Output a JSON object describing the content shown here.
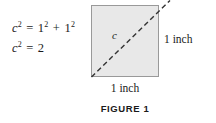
{
  "figure": {
    "caption": "FIGURE 1",
    "equations": [
      {
        "lhs_var": "c",
        "lhs_exp": "2",
        "equals": "=",
        "terms": [
          {
            "base": "1",
            "exp": "2"
          },
          {
            "base": "1",
            "exp": "2"
          }
        ],
        "operator": "+",
        "text": "c2 = 12 + 12"
      },
      {
        "lhs_var": "c",
        "lhs_exp": "2",
        "equals": "=",
        "result": "2",
        "text": "c2 = 2"
      }
    ],
    "shape": {
      "type": "square",
      "fill_color": "#e8e8e8",
      "border_color": "#999999",
      "diagonal_style": "dashed",
      "diagonal_color": "#333333",
      "diagonal_label": "c",
      "side_label_bottom": "1 inch",
      "side_label_right": "1 inch"
    }
  }
}
